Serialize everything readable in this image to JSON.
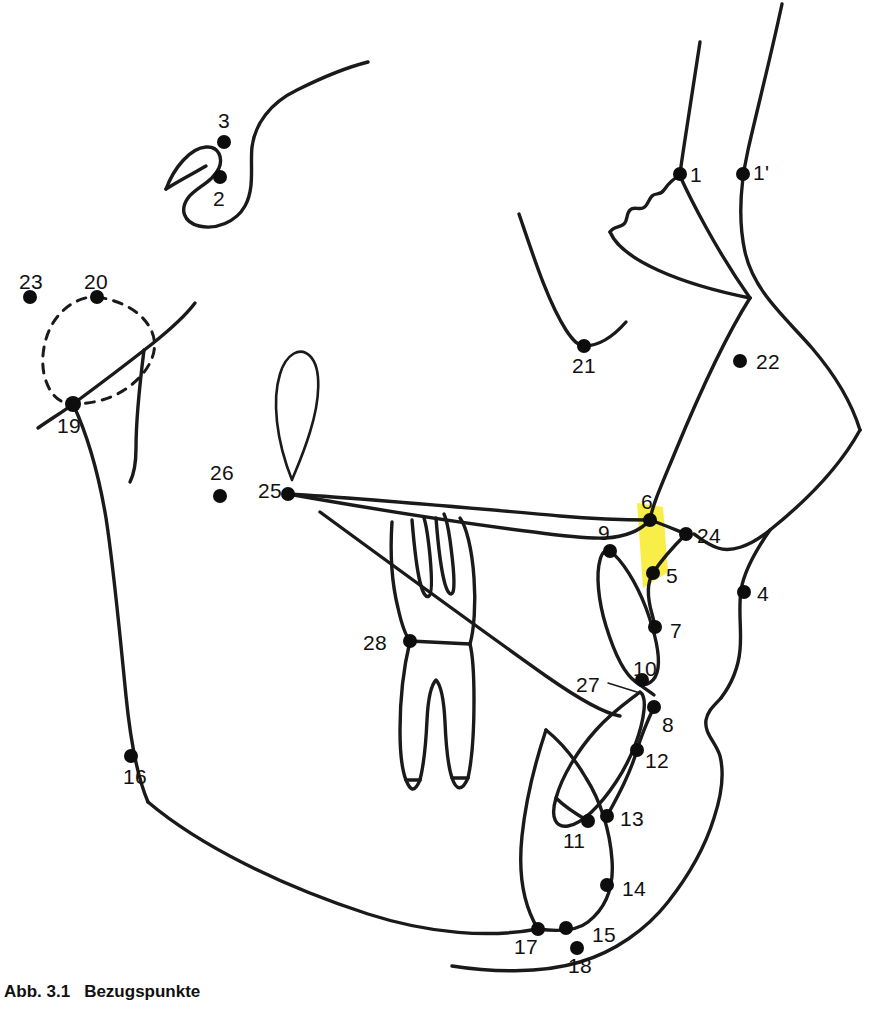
{
  "figure": {
    "caption_number": "Abb. 3.1",
    "caption_text": "Bezugspunkte",
    "kind": "cephalometric-tracing",
    "width": 877,
    "height": 1010,
    "background_color": "#ffffff",
    "line_color": "#1a1a1a",
    "dot_color": "#0d0d0d",
    "highlight_color": "#f9ee47"
  },
  "landmarks": [
    {
      "id": "1",
      "label": "1",
      "dot": {
        "x": 680,
        "y": 174
      },
      "text": {
        "x": 690,
        "y": 164
      }
    },
    {
      "id": "1p",
      "label": "1'",
      "dot": {
        "x": 743,
        "y": 174
      },
      "text": {
        "x": 753,
        "y": 162
      }
    },
    {
      "id": "2",
      "label": "2",
      "dot": {
        "x": 220,
        "y": 177
      },
      "text": {
        "x": 213,
        "y": 188
      }
    },
    {
      "id": "3",
      "label": "3",
      "dot": {
        "x": 224,
        "y": 142
      },
      "text": {
        "x": 218,
        "y": 110
      }
    },
    {
      "id": "4",
      "label": "4",
      "dot": {
        "x": 744,
        "y": 592
      },
      "text": {
        "x": 757,
        "y": 583
      }
    },
    {
      "id": "5",
      "label": "5",
      "dot": {
        "x": 653,
        "y": 573
      },
      "text": {
        "x": 666,
        "y": 565
      }
    },
    {
      "id": "6",
      "label": "6",
      "dot": {
        "x": 650,
        "y": 520
      },
      "text": {
        "x": 641,
        "y": 491
      }
    },
    {
      "id": "7",
      "label": "7",
      "dot": {
        "x": 655,
        "y": 627
      },
      "text": {
        "x": 670,
        "y": 620
      }
    },
    {
      "id": "8",
      "label": "8",
      "dot": {
        "x": 654,
        "y": 707
      },
      "text": {
        "x": 662,
        "y": 718
      }
    },
    {
      "id": "9",
      "label": "9",
      "dot": {
        "x": 610,
        "y": 551
      },
      "text": {
        "x": 598,
        "y": 522
      }
    },
    {
      "id": "10",
      "label": "10",
      "dot": {
        "x": 642,
        "y": 680
      },
      "text": {
        "x": 637,
        "y": 660
      }
    },
    {
      "id": "11",
      "label": "11",
      "dot": {
        "x": 588,
        "y": 821
      },
      "text": {
        "x": 565,
        "y": 830
      }
    },
    {
      "id": "12",
      "label": "12",
      "dot": {
        "x": 637,
        "y": 750
      },
      "text": {
        "x": 645,
        "y": 753
      }
    },
    {
      "id": "13",
      "label": "13",
      "dot": {
        "x": 607,
        "y": 816
      },
      "text": {
        "x": 620,
        "y": 810
      }
    },
    {
      "id": "14",
      "label": "14",
      "dot": {
        "x": 607,
        "y": 885
      },
      "text": {
        "x": 622,
        "y": 878
      }
    },
    {
      "id": "15",
      "label": "15",
      "dot": {
        "x": 566,
        "y": 928
      },
      "text": {
        "x": 592,
        "y": 926
      }
    },
    {
      "id": "16",
      "label": "16",
      "dot": {
        "x": 131,
        "y": 756
      },
      "text": {
        "x": 125,
        "y": 766
      }
    },
    {
      "id": "17",
      "label": "17",
      "dot": {
        "x": 538,
        "y": 929
      },
      "text": {
        "x": 516,
        "y": 936
      }
    },
    {
      "id": "18",
      "label": "18",
      "dot": {
        "x": 577,
        "y": 948
      },
      "text": {
        "x": 570,
        "y": 953
      }
    },
    {
      "id": "19",
      "label": "19",
      "dot": {
        "x": 73,
        "y": 404
      },
      "text": {
        "x": 60,
        "y": 415
      }
    },
    {
      "id": "20",
      "label": "20",
      "dot": {
        "x": 97,
        "y": 297
      },
      "text": {
        "x": 86,
        "y": 273
      }
    },
    {
      "id": "21",
      "label": "21",
      "dot": {
        "x": 584,
        "y": 346
      },
      "text": {
        "x": 574,
        "y": 355
      }
    },
    {
      "id": "22",
      "label": "22",
      "dot": {
        "x": 740,
        "y": 361
      },
      "text": {
        "x": 756,
        "y": 352
      }
    },
    {
      "id": "23",
      "label": "23",
      "dot": {
        "x": 30,
        "y": 297
      },
      "text": {
        "x": 21,
        "y": 272
      }
    },
    {
      "id": "24",
      "label": "24",
      "dot": {
        "x": 686,
        "y": 534
      },
      "text": {
        "x": 697,
        "y": 527
      }
    },
    {
      "id": "25",
      "label": "25",
      "dot": {
        "x": 288,
        "y": 494
      },
      "text": {
        "x": 260,
        "y": 481
      }
    },
    {
      "id": "26",
      "label": "26",
      "dot": {
        "x": 220,
        "y": 496
      },
      "text": {
        "x": 212,
        "y": 464
      }
    },
    {
      "id": "27",
      "label": "27",
      "dot": null,
      "text": {
        "x": 578,
        "y": 676
      }
    },
    {
      "id": "28",
      "label": "28",
      "dot": {
        "x": 410,
        "y": 641
      },
      "text": {
        "x": 365,
        "y": 634
      }
    }
  ],
  "annotations": {
    "leader_27": {
      "from": {
        "x": 610,
        "y": 683
      },
      "to": {
        "x": 640,
        "y": 692
      }
    },
    "highlight_band": {
      "x": 636,
      "y": 505,
      "width": 26,
      "height": 80
    }
  }
}
